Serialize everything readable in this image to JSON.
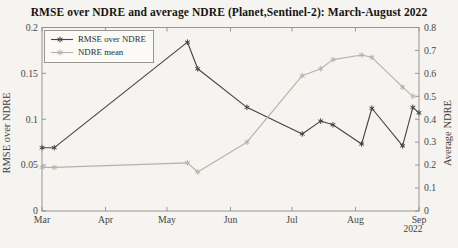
{
  "chart_data": {
    "type": "line",
    "title": "RMSE over NDRE and average NDRE (Planet,Sentinel-2): March-August 2022",
    "x_axis": {
      "tick_labels": [
        "Mar",
        "Apr",
        "May",
        "Jun",
        "Jul",
        "Aug",
        "Sep"
      ],
      "tick_days": [
        0,
        31,
        61,
        92,
        122,
        153,
        184
      ],
      "range_days": [
        0,
        184
      ],
      "secondary_label": "2022"
    },
    "left_axis": {
      "label": "RMSE over NDRE",
      "range": [
        0,
        0.2
      ],
      "ticks": [
        0,
        0.05,
        0.1,
        0.15,
        0.2
      ],
      "tick_labels": [
        "0",
        "0.05",
        "0.1",
        "0.15",
        "0.2"
      ]
    },
    "right_axis": {
      "label": "Average NDRE",
      "range": [
        0,
        0.8
      ],
      "ticks": [
        0,
        0.1,
        0.2,
        0.3,
        0.4,
        0.5,
        0.6,
        0.7,
        0.8
      ],
      "tick_labels": [
        "0",
        "0.1",
        "0.2",
        "0.3",
        "0.4",
        "0.5",
        "0.6",
        "0.7",
        "0.8"
      ]
    },
    "legend": {
      "position": "top-left"
    },
    "series": [
      {
        "name": "RMSE over NDRE",
        "axis": "left",
        "color": "#454340",
        "marker": "asterisk",
        "x_days": [
          0,
          6,
          71,
          76,
          100,
          127,
          136,
          142,
          156,
          161,
          176,
          181,
          184
        ],
        "values": [
          0.069,
          0.069,
          0.184,
          0.155,
          0.113,
          0.084,
          0.098,
          0.094,
          0.073,
          0.112,
          0.071,
          0.113,
          0.107
        ]
      },
      {
        "name": "NDRE mean",
        "axis": "right",
        "color": "#b6b2aa",
        "marker": "asterisk",
        "x_days": [
          0,
          6,
          71,
          76,
          100,
          127,
          136,
          142,
          156,
          161,
          176,
          181
        ],
        "values": [
          0.19,
          0.19,
          0.21,
          0.17,
          0.3,
          0.59,
          0.62,
          0.66,
          0.68,
          0.67,
          0.54,
          0.5
        ]
      }
    ],
    "frame_color": "#8f8d88",
    "tick_text_color": "#47463f"
  }
}
